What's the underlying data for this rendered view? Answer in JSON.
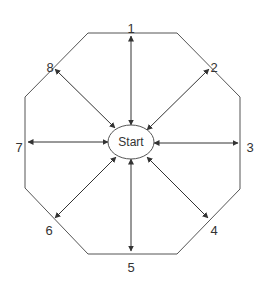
{
  "diagram": {
    "center": {
      "label": "Start",
      "cx": 131,
      "cy": 142,
      "rx": 23,
      "ry": 17
    },
    "stroke_color": "#555555",
    "arrow_color": "#333333",
    "octagon": [
      [
        88,
        33
      ],
      [
        177,
        33
      ],
      [
        240,
        97
      ],
      [
        240,
        189
      ],
      [
        177,
        254
      ],
      [
        88,
        254
      ],
      [
        25,
        188
      ],
      [
        25,
        97
      ]
    ],
    "nodes": [
      {
        "label": "1",
        "lx": 131,
        "ly": 28,
        "tip": [
          131,
          36
        ],
        "base": [
          131,
          125
        ]
      },
      {
        "label": "2",
        "lx": 214,
        "ly": 67,
        "tip": [
          209,
          69
        ],
        "base": [
          147,
          130
        ]
      },
      {
        "label": "3",
        "lx": 250,
        "ly": 147,
        "tip": [
          238,
          143
        ],
        "base": [
          154,
          143
        ]
      },
      {
        "label": "4",
        "lx": 214,
        "ly": 230,
        "tip": [
          208,
          218
        ],
        "base": [
          147,
          157
        ]
      },
      {
        "label": "5",
        "lx": 131,
        "ly": 267,
        "tip": [
          131,
          251
        ],
        "base": [
          131,
          159
        ]
      },
      {
        "label": "6",
        "lx": 49,
        "ly": 230,
        "tip": [
          55,
          218
        ],
        "base": [
          116,
          157
        ]
      },
      {
        "label": "7",
        "lx": 19,
        "ly": 147,
        "tip": [
          28,
          142
        ],
        "base": [
          108,
          142
        ]
      },
      {
        "label": "8",
        "lx": 50,
        "ly": 67,
        "tip": [
          55,
          69
        ],
        "base": [
          115,
          128
        ]
      }
    ]
  }
}
